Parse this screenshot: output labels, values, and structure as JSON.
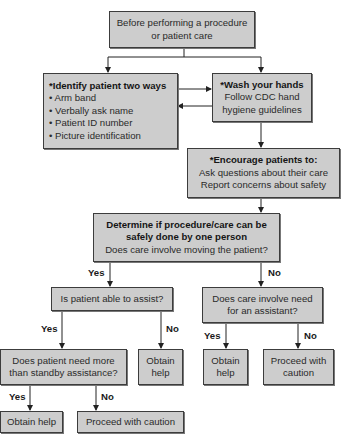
{
  "flowchart": {
    "start": {
      "lines": [
        "Before performing a procedure",
        "or patient care"
      ]
    },
    "identify": {
      "title": "*Identify patient two ways",
      "items": [
        "• Arm band",
        "• Verbally ask name",
        "• Patient ID number",
        "• Picture identification"
      ]
    },
    "wash": {
      "title": "*Wash your hands",
      "lines": [
        "Follow CDC hand",
        "hygiene guidelines"
      ]
    },
    "encourage": {
      "title": "*Encourage patients to:",
      "lines": [
        "Ask questions about their care",
        "Report concerns about safety"
      ]
    },
    "determine": {
      "title_lines": [
        "Determine if procedure/care can be",
        "safely done by one person"
      ],
      "question": "Does care involve moving the patient?"
    },
    "assist": {
      "question": "Is patient able to assist?"
    },
    "assistant": {
      "lines": [
        "Does care involve need",
        "for an assistant?"
      ]
    },
    "standby": {
      "lines": [
        "Does patient need more",
        "than standby assistance?"
      ]
    },
    "assist_no_result": {
      "lines": [
        "Obtain",
        "help"
      ]
    },
    "assistant_yes_result": {
      "lines": [
        "Obtain",
        "help"
      ]
    },
    "assistant_no_result": {
      "lines": [
        "Proceed with",
        "caution"
      ]
    },
    "standby_yes_result": {
      "text": "Obtain help"
    },
    "standby_no_result": {
      "text": "Proceed with caution"
    },
    "edge_labels": {
      "determine_yes": "Yes",
      "determine_no": "No",
      "assist_yes": "Yes",
      "assist_no": "No",
      "assistant_yes": "Yes",
      "assistant_no": "No",
      "standby_yes": "Yes",
      "standby_no": "No"
    },
    "colors": {
      "box_fill": "#cdcdcd",
      "box_border": "#3c3c3c",
      "line": "#222222"
    }
  }
}
